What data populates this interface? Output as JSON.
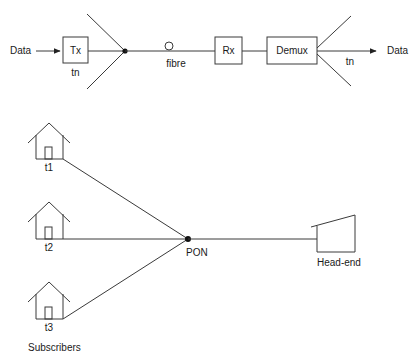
{
  "top_link": {
    "input_label": "Data",
    "transmitter": "Tx",
    "tx_sublabel": "tn",
    "medium_label": "fibre",
    "receiver": "Rx",
    "demultiplexer": "Demux",
    "demux_sublabel": "tn",
    "output_label": "Data"
  },
  "tdm_timeline": {
    "guardbands_label": "guardbands",
    "slots": [
      "t1",
      "t2",
      "t3"
    ],
    "axis_label": "time",
    "arrow_label": "(time slots)"
  },
  "pon_network": {
    "subscribers": [
      {
        "label": "t1"
      },
      {
        "label": "t2"
      },
      {
        "label": "t3"
      }
    ],
    "subscribers_label": "Subscribers",
    "splitter_label": "PON",
    "headend_label": "Head-end"
  },
  "colors": {
    "line": "#3a3a3a",
    "text": "#1a1a1a",
    "background": "#ffffff"
  }
}
